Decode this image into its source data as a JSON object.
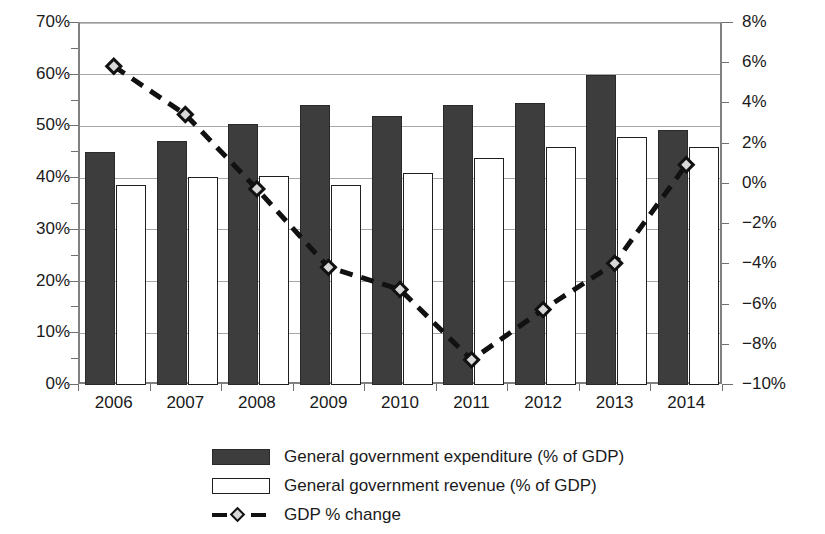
{
  "chart_data": {
    "type": "bar",
    "title": "",
    "subtitle": "",
    "xlabel": "",
    "ylabel": "",
    "grid": true,
    "legend_position": "bottom",
    "categories": [
      "2006",
      "2007",
      "2008",
      "2009",
      "2010",
      "2011",
      "2012",
      "2013",
      "2014"
    ],
    "left_axis": {
      "label": "",
      "ylim": [
        0,
        70
      ],
      "tick_step": 10,
      "ticks": [
        "0%",
        "10%",
        "20%",
        "30%",
        "40%",
        "50%",
        "60%",
        "70%"
      ],
      "tick_values": [
        0,
        10,
        20,
        30,
        40,
        50,
        60,
        70
      ]
    },
    "right_axis": {
      "label": "",
      "ylim": [
        -10,
        8
      ],
      "tick_step": 2,
      "ticks": [
        "−10%",
        "−8%",
        "−6%",
        "−4%",
        "−2%",
        "0%",
        "2%",
        "4%",
        "6%",
        "8%"
      ],
      "tick_values": [
        -10,
        -8,
        -6,
        -4,
        -2,
        0,
        2,
        4,
        6,
        8
      ]
    },
    "series": [
      {
        "name": "General government expenditure (% of GDP)",
        "type": "bar",
        "axis": "left",
        "color": "#3d3d3d",
        "values": [
          45.1,
          47.1,
          50.4,
          54.1,
          52.1,
          54.1,
          54.5,
          60.0,
          49.4
        ]
      },
      {
        "name": "General government revenue (% of GDP)",
        "type": "bar",
        "axis": "left",
        "color": "#ffffff",
        "values": [
          38.7,
          40.2,
          40.5,
          38.7,
          41.0,
          43.8,
          46.0,
          48.0,
          46.0
        ]
      },
      {
        "name": "GDP % change",
        "type": "line",
        "axis": "right",
        "color": "#111111",
        "values": [
          5.8,
          3.4,
          -0.3,
          -4.2,
          -5.3,
          -8.8,
          -6.3,
          -4.0,
          0.9
        ]
      }
    ]
  },
  "legend": {
    "items": [
      {
        "label": "General government expenditure (% of GDP)",
        "swatch": "filled-dark-rect"
      },
      {
        "label": "General government revenue (% of GDP)",
        "swatch": "outlined-white-rect"
      },
      {
        "label": "GDP % change",
        "swatch": "dashed-line-diamond-marker"
      }
    ]
  },
  "colors": {
    "expenditure_fill": "#3d3d3d",
    "revenue_fill": "#ffffff",
    "revenue_stroke": "#1f1f1f",
    "line": "#111111",
    "marker_fill": "#d8d8d8",
    "grid": "#a8a8a8",
    "axis": "#808080",
    "text": "#1a1a1a",
    "background": "#ffffff"
  }
}
